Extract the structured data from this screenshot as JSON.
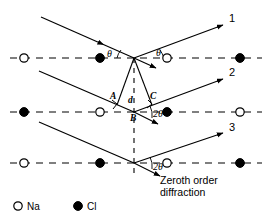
{
  "figure": {
    "colors": {
      "ink": "#000000",
      "background": "#ffffff"
    },
    "ray_labels": [
      {
        "id": "ray-1",
        "text": "1",
        "x": 229,
        "y": 22
      },
      {
        "id": "ray-2",
        "text": "2",
        "x": 229,
        "y": 76
      },
      {
        "id": "ray-3",
        "text": "3",
        "x": 229,
        "y": 131
      }
    ],
    "angle_labels": [
      {
        "id": "theta-incident-top",
        "text": "θ",
        "x": 107,
        "y": 57
      },
      {
        "id": "theta-reflected-top",
        "text": "θ",
        "x": 156,
        "y": 56
      },
      {
        "id": "two-theta-middle",
        "text": "2θ",
        "x": 153,
        "y": 117
      },
      {
        "id": "two-theta-bottom",
        "text": "2θ",
        "x": 153,
        "y": 170
      }
    ],
    "point_labels": [
      {
        "id": "point-A",
        "text": "A",
        "x": 110,
        "y": 99
      },
      {
        "id": "spacing-d",
        "text": "d",
        "x": 128,
        "y": 103
      },
      {
        "id": "point-C",
        "text": "C",
        "x": 150,
        "y": 99
      },
      {
        "id": "point-B",
        "text": "B",
        "x": 130,
        "y": 121
      }
    ],
    "caption": {
      "line1": "Zeroth order",
      "line2": "diffraction",
      "x": 160,
      "y": 181
    },
    "legend": {
      "na": {
        "symbol": "open-circle",
        "label": "Na",
        "x": 18,
        "y": 205
      },
      "cl": {
        "symbol": "filled-circle",
        "label": "Cl",
        "x": 78,
        "y": 205
      }
    },
    "lattice_rows": [
      {
        "y": 58,
        "atoms": [
          {
            "x": 24,
            "type": "Na"
          },
          {
            "x": 100,
            "type": "Cl"
          },
          {
            "x": 167,
            "type": "Na"
          },
          {
            "x": 240,
            "type": "Cl"
          }
        ]
      },
      {
        "y": 112,
        "atoms": [
          {
            "x": 24,
            "type": "Cl"
          },
          {
            "x": 100,
            "type": "Na"
          },
          {
            "x": 167,
            "type": "Cl"
          },
          {
            "x": 240,
            "type": "Na"
          }
        ]
      },
      {
        "y": 163,
        "atoms": [
          {
            "x": 24,
            "type": "Na"
          },
          {
            "x": 100,
            "type": "Cl"
          },
          {
            "x": 167,
            "type": "Na"
          },
          {
            "x": 240,
            "type": "Cl"
          }
        ]
      }
    ],
    "vertices": {
      "top_scatter": {
        "x": 134,
        "y": 58
      },
      "mid_scatter": {
        "x": 134,
        "y": 112
      },
      "bot_scatter": {
        "x": 134,
        "y": 163
      }
    }
  }
}
